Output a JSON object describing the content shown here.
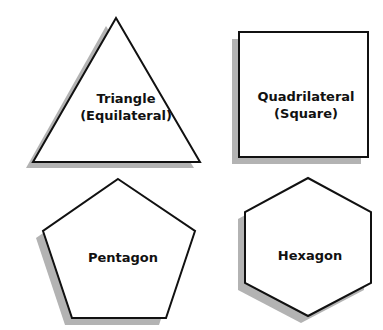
{
  "shapes": [
    {
      "id": "triangle",
      "line1": "Triangle",
      "line2": "(Equilateral)"
    },
    {
      "id": "quadrilateral",
      "line1": "Quadrilateral",
      "line2": "(Square)"
    },
    {
      "id": "pentagon",
      "line1": "Pentagon",
      "line2": ""
    },
    {
      "id": "hexagon",
      "line1": "Hexagon",
      "line2": ""
    }
  ],
  "colors": {
    "fill": "#ffffff",
    "stroke": "#111111",
    "shadow": "#b3b3b3"
  }
}
